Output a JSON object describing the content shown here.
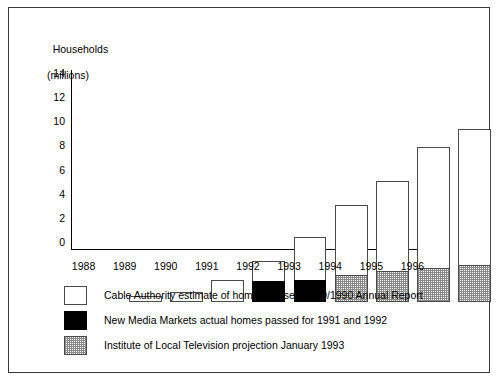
{
  "chart_data": {
    "type": "bar",
    "title": "",
    "subtitle": "",
    "ylabel_line1": "Households",
    "ylabel_line2": "(millions)",
    "xlabel": "",
    "grid": false,
    "stacked": true,
    "ylim": [
      0,
      15.2
    ],
    "yticks": [
      14,
      12,
      10,
      8,
      6,
      4,
      2,
      0
    ],
    "categories": [
      "1988",
      "1989",
      "1990",
      "1991",
      "1992",
      "1993",
      "1994",
      "1995",
      "1996"
    ],
    "series": [
      {
        "name": "Cable Authority estimate of homes passed 1989/1990 Annual Report",
        "style": "white",
        "color": "#ffffff",
        "values": [
          0.5,
          0.8,
          1.8,
          3.4,
          5.4,
          8.0,
          10.0,
          12.8,
          14.3
        ]
      },
      {
        "name": "New Media Markets actual homes passed for 1991 and 1992",
        "style": "black",
        "color": "#000000",
        "values": [
          0,
          0,
          0,
          1.7,
          1.85,
          0,
          0,
          0,
          0
        ]
      },
      {
        "name": "Institute of Local Television projection January 1993",
        "style": "stipple",
        "color": "#8a8a8a",
        "values": [
          0,
          0,
          0,
          0,
          0,
          2.2,
          2.6,
          2.85,
          3.1
        ]
      }
    ],
    "legend_position": "below-plot",
    "legend": [
      {
        "style": "white",
        "label": "Cable Authority estimate of homes passed 1989/1990 Annual Report"
      },
      {
        "style": "black",
        "label": "New Media Markets actual homes passed for 1991 and 1992"
      },
      {
        "style": "stipple",
        "label": "Institute of Local Television projection January 1993"
      }
    ]
  }
}
